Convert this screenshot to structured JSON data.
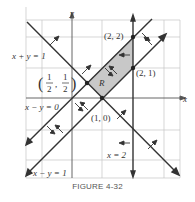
{
  "caption": "FIGURE 4-32",
  "axes": {
    "x_label": "x",
    "y_label": "y"
  },
  "region_label": "R",
  "lines": [
    {
      "label": "x + y = 1"
    },
    {
      "label": "x − y = 0"
    },
    {
      "label": "x − y = 1"
    },
    {
      "label": "x = 2"
    }
  ],
  "points": [
    {
      "label": "(2, 2)"
    },
    {
      "label": "(2, 1)"
    },
    {
      "label": "(1, 0)"
    },
    {
      "label_num": "1",
      "label_den": "2"
    }
  ],
  "colors": {
    "region_fill": "#c8c8c8",
    "line": "#333333",
    "grid": "#bbbbbb"
  }
}
